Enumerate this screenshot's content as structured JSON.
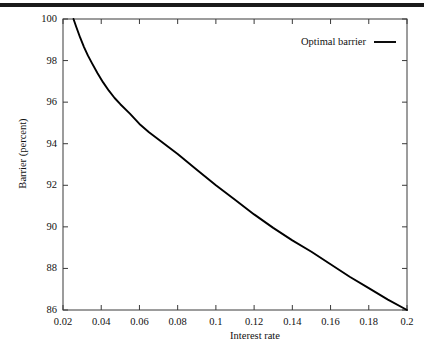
{
  "chart_data": {
    "type": "line",
    "title": "",
    "xlabel": "Interest rate",
    "ylabel": "Barrier (percent)",
    "xlim": [
      0.02,
      0.2
    ],
    "ylim": [
      86,
      100
    ],
    "grid": false,
    "legend_position": "top-right",
    "series": [
      {
        "name": "Optimal barrier",
        "color": "#000000",
        "x": [
          0.0255,
          0.027,
          0.029,
          0.031,
          0.033,
          0.035,
          0.038,
          0.041,
          0.044,
          0.047,
          0.05,
          0.055,
          0.06,
          0.065,
          0.07,
          0.075,
          0.08,
          0.09,
          0.1,
          0.11,
          0.12,
          0.13,
          0.14,
          0.15,
          0.16,
          0.17,
          0.18,
          0.19,
          0.2
        ],
        "y": [
          100.0,
          99.6,
          99.1,
          98.65,
          98.25,
          97.9,
          97.4,
          96.95,
          96.55,
          96.2,
          95.9,
          95.45,
          94.95,
          94.55,
          94.2,
          93.85,
          93.5,
          92.75,
          92.0,
          91.3,
          90.6,
          89.95,
          89.35,
          88.8,
          88.2,
          87.6,
          87.05,
          86.5,
          86.0
        ]
      }
    ],
    "xticks": [
      0.02,
      0.04,
      0.06,
      0.08,
      0.1,
      0.12,
      0.14,
      0.16,
      0.18,
      0.2
    ],
    "xticklabels": [
      "0.02",
      "0.04",
      "0.06",
      "0.08",
      "0.1",
      "0.12",
      "0.14",
      "0.16",
      "0.18",
      "0.2"
    ],
    "yticks": [
      86,
      88,
      90,
      92,
      94,
      96,
      98,
      100
    ],
    "yticklabels": [
      "86",
      "88",
      "90",
      "92",
      "94",
      "96",
      "98",
      "100"
    ]
  },
  "legend": {
    "entries": [
      {
        "label": "Optimal barrier"
      }
    ]
  },
  "colors": {
    "curve": "#000000",
    "axis": "#3a3a3a",
    "rule": "#1a1a1a",
    "background": "#ffffff"
  }
}
